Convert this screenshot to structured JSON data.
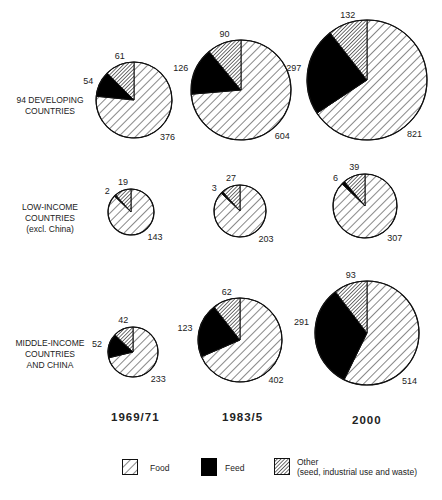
{
  "chart_data": {
    "type": "pie",
    "title": "",
    "columns": [
      "1969/71",
      "1983/5",
      "2000"
    ],
    "rows": [
      {
        "label": "94 DEVELOPING COUNTRIES",
        "label_lines": [
          "94 DEVELOPING",
          "COUNTRIES"
        ],
        "pies": [
          {
            "period": "1969/71",
            "food": 376,
            "feed": 54,
            "other": 61
          },
          {
            "period": "1983/5",
            "food": 604,
            "feed": 126,
            "other": 90
          },
          {
            "period": "2000",
            "food": 821,
            "feed": 297,
            "other": 132
          }
        ]
      },
      {
        "label": "LOW-INCOME COUNTRIES (excl. China)",
        "label_lines": [
          "LOW-INCOME",
          "COUNTRIES",
          "(excl. China)"
        ],
        "pies": [
          {
            "period": "1969/71",
            "food": 143,
            "feed": 2,
            "other": 19
          },
          {
            "period": "1983/5",
            "food": 203,
            "feed": 3,
            "other": 27
          },
          {
            "period": "2000",
            "food": 307,
            "feed": 6,
            "other": 39
          }
        ]
      },
      {
        "label": "MIDDLE-INCOME COUNTRIES AND CHINA",
        "label_lines": [
          "MIDDLE-INCOME",
          "COUNTRIES",
          "AND CHINA"
        ],
        "pies": [
          {
            "period": "1969/71",
            "food": 233,
            "feed": 52,
            "other": 42
          },
          {
            "period": "1983/5",
            "food": 402,
            "feed": 123,
            "other": 62
          },
          {
            "period": "2000",
            "food": 514,
            "feed": 291,
            "other": 93
          }
        ]
      }
    ],
    "legend": [
      {
        "key": "food",
        "label": "Food",
        "pattern": "sparse-diagonal-hatch"
      },
      {
        "key": "feed",
        "label": "Feed",
        "pattern": "solid-black"
      },
      {
        "key": "other",
        "label": "Other",
        "sublabel": "(seed, industrial use and waste)",
        "pattern": "dense-diagonal-hatch"
      }
    ],
    "note": "Pie area proportional to total; slices start at 12 o'clock, Food clockwise, Other and Feed counter-clockwise."
  },
  "layout": {
    "pies": [
      [
        {
          "cx": 134,
          "cy": 100,
          "r": 38
        },
        {
          "cx": 241,
          "cy": 90,
          "r": 50
        },
        {
          "cx": 367,
          "cy": 80,
          "r": 60
        }
      ],
      [
        {
          "cx": 131,
          "cy": 212,
          "r": 23
        },
        {
          "cx": 240,
          "cy": 211,
          "r": 26
        },
        {
          "cx": 365,
          "cy": 206,
          "r": 32
        }
      ],
      [
        {
          "cx": 133,
          "cy": 352,
          "r": 25
        },
        {
          "cx": 240,
          "cy": 340,
          "r": 42
        },
        {
          "cx": 367,
          "cy": 333,
          "r": 52
        }
      ]
    ]
  },
  "labels": {
    "row0": [
      "94 DEVELOPING",
      "COUNTRIES"
    ],
    "row1": [
      "LOW-INCOME",
      "COUNTRIES",
      "(excl. China)"
    ],
    "row2": [
      "MIDDLE-INCOME",
      "COUNTRIES",
      "AND CHINA"
    ],
    "years": [
      "1969/71",
      "1983/5",
      "2000"
    ],
    "legend_food": "Food",
    "legend_feed": "Feed",
    "legend_other": "Other",
    "legend_other_sub": "(seed, industrial use and waste)"
  },
  "colors": {
    "line": "#111111",
    "fill_feed": "#000000",
    "background": "#ffffff"
  }
}
